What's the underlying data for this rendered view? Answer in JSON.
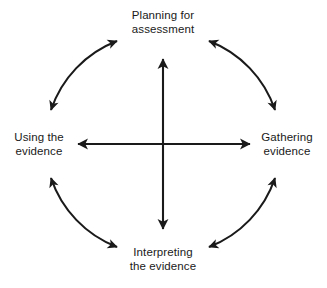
{
  "diagram": {
    "type": "cycle-diagram",
    "canvas": {
      "width": 327,
      "height": 288
    },
    "colors": {
      "background": "#ffffff",
      "stroke": "#1a1a1a",
      "text": "#1a1a1a"
    },
    "geometry": {
      "center_x": 163,
      "center_y": 144,
      "circle_radius": 112,
      "cross_horizontal_left_x": 75,
      "cross_horizontal_right_x": 253,
      "cross_vertical_top_y": 56,
      "cross_vertical_bottom_y": 232
    },
    "nodes": [
      {
        "id": "planning",
        "label": "Planning for\nassessment",
        "position": "top"
      },
      {
        "id": "gathering",
        "label": "Gathering\nevidence",
        "position": "right"
      },
      {
        "id": "interpreting",
        "label": "Interpreting\nthe evidence",
        "position": "bottom"
      },
      {
        "id": "using",
        "label": "Using the\nevidence",
        "position": "left"
      }
    ],
    "connectors": [
      {
        "id": "arc-top-left",
        "from": "using",
        "to": "planning",
        "style": "curved",
        "arrowheads": "both"
      },
      {
        "id": "arc-top-right",
        "from": "planning",
        "to": "gathering",
        "style": "curved",
        "arrowheads": "both"
      },
      {
        "id": "arc-bottom-right",
        "from": "gathering",
        "to": "interpreting",
        "style": "curved",
        "arrowheads": "both"
      },
      {
        "id": "arc-bottom-left",
        "from": "interpreting",
        "to": "using",
        "style": "curved",
        "arrowheads": "both"
      },
      {
        "id": "axis-horizontal",
        "from": "using",
        "to": "gathering",
        "style": "straight",
        "arrowheads": "both"
      },
      {
        "id": "axis-vertical",
        "from": "planning",
        "to": "interpreting",
        "style": "straight",
        "arrowheads": "both"
      }
    ]
  }
}
